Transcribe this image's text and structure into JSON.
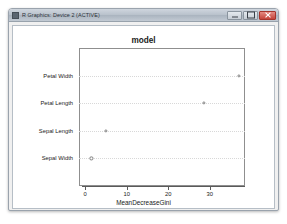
{
  "window": {
    "title": "R Graphics: Device 2 (ACTIVE)",
    "icon": "r-graphics-icon",
    "controls": {
      "minimize": "Minimize",
      "maximize": "Maximize",
      "close": "Close"
    }
  },
  "chart_data": {
    "type": "scatter",
    "title": "model",
    "xlabel": "MeanDecreaseGini",
    "ylabel": "",
    "categories": [
      "Sepal Width",
      "Sepal Length",
      "Petal Length",
      "Petal Width"
    ],
    "values": [
      1.5,
      5.0,
      28.5,
      37.0
    ],
    "xticks": [
      0,
      10,
      20,
      30
    ],
    "xticklabels": [
      "0",
      "10",
      "20",
      "30"
    ],
    "xlim": [
      -1.5,
      38.5
    ],
    "grid": true,
    "legend": null,
    "point_style": "open-circle",
    "point_color": "#808080"
  }
}
